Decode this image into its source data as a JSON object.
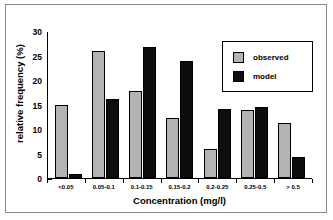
{
  "chart_data": {
    "type": "bar",
    "title": "",
    "xlabel": "Concentration (mg/l)",
    "ylabel": "relative frequency (%)",
    "categories": [
      "<0.05",
      "0.05-0.1",
      "0.1-0.15",
      "0.15-0.2",
      "0.2-0.25",
      "0.25-0.5",
      "> 0.5"
    ],
    "series": [
      {
        "name": "observed",
        "color": "#b3b3b3",
        "values": [
          14.8,
          26.0,
          17.8,
          12.2,
          5.9,
          13.8,
          11.2
        ]
      },
      {
        "name": "model",
        "color": "#0d0d0d",
        "values": [
          0.8,
          16.1,
          26.8,
          23.9,
          14.1,
          14.5,
          4.3
        ]
      }
    ],
    "ylim": [
      0,
      30
    ],
    "yticks": [
      0,
      5,
      10,
      15,
      20,
      25,
      30
    ],
    "ytick_labels": [
      "0",
      "5",
      "10",
      "15",
      "20",
      "25",
      "30"
    ],
    "yminor_step": 2.5,
    "grid": false,
    "legend_position": "top-right",
    "legend_entries": [
      "observed",
      "model"
    ]
  }
}
